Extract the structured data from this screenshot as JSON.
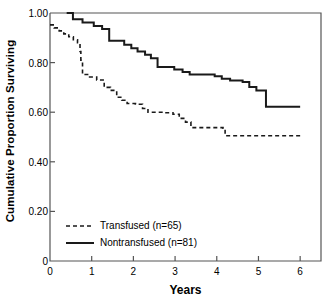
{
  "chart_data": {
    "type": "line",
    "title": "",
    "xlabel": "Years",
    "ylabel": "Cumulative Proportion Surviving",
    "xlim": [
      0,
      6.5
    ],
    "ylim": [
      0,
      1.0
    ],
    "xticks": [
      0,
      1,
      2,
      3,
      4,
      5,
      6
    ],
    "xtick_labels": [
      "0",
      "1",
      "2",
      "3",
      "4",
      "5",
      "6"
    ],
    "yticks": [
      0,
      0.2,
      0.4,
      0.6,
      0.8,
      1.0
    ],
    "ytick_labels": [
      "0",
      "0.20",
      "0.40",
      "0.60",
      "0.80",
      "1.00"
    ],
    "grid": false,
    "legend_position": "lower-left",
    "step_style": "post",
    "series": [
      {
        "name": "Transfused (n=65)",
        "label": "Transfused (n=65)",
        "style": "dashed",
        "color": "#1a1a1a",
        "n": 65,
        "x": [
          0,
          0.1,
          0.22,
          0.33,
          0.45,
          0.56,
          0.66,
          0.72,
          0.74,
          0.78,
          0.95,
          1.12,
          1.3,
          1.45,
          1.6,
          1.72,
          1.85,
          2.05,
          2.22,
          2.35,
          2.75,
          2.95,
          3.1,
          3.25,
          3.38,
          4.15,
          4.2,
          6.0
        ],
        "y": [
          0.952,
          0.94,
          0.928,
          0.916,
          0.904,
          0.892,
          0.88,
          0.845,
          0.81,
          0.752,
          0.742,
          0.73,
          0.7,
          0.688,
          0.66,
          0.648,
          0.635,
          0.632,
          0.615,
          0.6,
          0.598,
          0.592,
          0.575,
          0.56,
          0.538,
          0.535,
          0.505,
          0.505
        ]
      },
      {
        "name": "Nontransfused (n=81)",
        "label": "Nontransfused (n=81)",
        "style": "solid",
        "color": "#1a1a1a",
        "n": 81,
        "x": [
          0.4,
          0.55,
          0.78,
          1.05,
          1.25,
          1.42,
          1.78,
          1.95,
          2.1,
          2.28,
          2.42,
          2.58,
          2.98,
          3.18,
          3.35,
          3.95,
          4.12,
          4.32,
          4.62,
          4.78,
          4.95,
          5.18,
          6.0
        ],
        "y": [
          1.0,
          0.975,
          0.962,
          0.948,
          0.935,
          0.888,
          0.872,
          0.858,
          0.845,
          0.832,
          0.818,
          0.782,
          0.772,
          0.762,
          0.752,
          0.745,
          0.735,
          0.728,
          0.722,
          0.702,
          0.688,
          0.622,
          0.622
        ]
      }
    ]
  },
  "axes": {
    "xlabel": "Years",
    "ylabel": "Cumulative Proportion Surviving"
  },
  "legend": {
    "entries": [
      {
        "label": "Transfused (n=65)",
        "style": "dashed"
      },
      {
        "label": "Nontransfused (n=81)",
        "style": "solid"
      }
    ]
  },
  "colors": {
    "line": "#1a1a1a",
    "axis": "#555555",
    "background": "#ffffff"
  }
}
